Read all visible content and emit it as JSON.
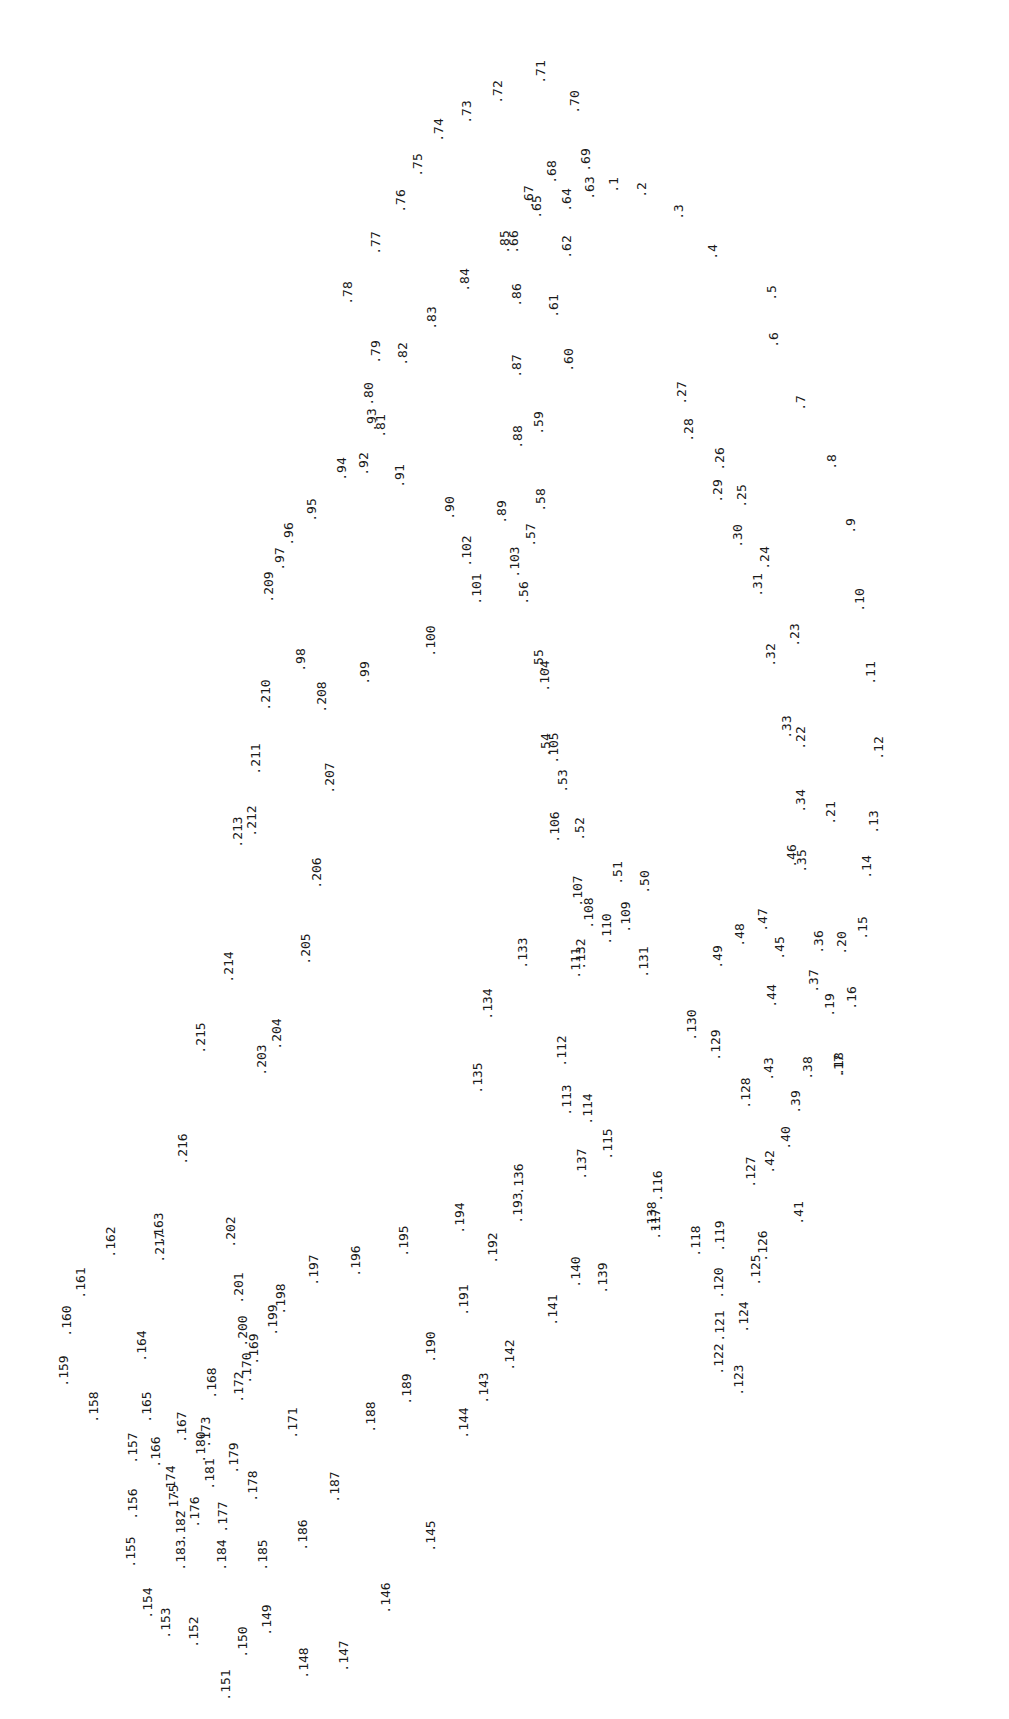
{
  "chart_data": {
    "type": "scatter",
    "title": "",
    "xlabel": "",
    "ylabel": "",
    "grid": false,
    "legend": null,
    "label_rotation_deg": -90,
    "note": "Dot-to-dot numbered point plot; each point is rendered as '.N' rotated 90° CCW. Coordinates are label-center pixel positions in the 1009x1719 image.",
    "points": [
      {
        "n": 1,
        "x": 613,
        "y": 185
      },
      {
        "n": 2,
        "x": 641,
        "y": 190
      },
      {
        "n": 3,
        "x": 678,
        "y": 212
      },
      {
        "n": 4,
        "x": 712,
        "y": 252
      },
      {
        "n": 5,
        "x": 771,
        "y": 293
      },
      {
        "n": 6,
        "x": 773,
        "y": 340
      },
      {
        "n": 7,
        "x": 800,
        "y": 403
      },
      {
        "n": 8,
        "x": 831,
        "y": 462
      },
      {
        "n": 9,
        "x": 850,
        "y": 526
      },
      {
        "n": 10,
        "x": 859,
        "y": 600
      },
      {
        "n": 11,
        "x": 870,
        "y": 673
      },
      {
        "n": 12,
        "x": 878,
        "y": 748
      },
      {
        "n": 13,
        "x": 873,
        "y": 822
      },
      {
        "n": 14,
        "x": 866,
        "y": 867
      },
      {
        "n": 15,
        "x": 862,
        "y": 928
      },
      {
        "n": 16,
        "x": 851,
        "y": 998
      },
      {
        "n": 17,
        "x": 838,
        "y": 1066
      },
      {
        "n": 18,
        "x": 838,
        "y": 1064
      },
      {
        "n": 19,
        "x": 829,
        "y": 1005
      },
      {
        "n": 20,
        "x": 841,
        "y": 943
      },
      {
        "n": 21,
        "x": 830,
        "y": 813
      },
      {
        "n": 22,
        "x": 800,
        "y": 738
      },
      {
        "n": 23,
        "x": 794,
        "y": 635
      },
      {
        "n": 24,
        "x": 764,
        "y": 558
      },
      {
        "n": 25,
        "x": 741,
        "y": 496
      },
      {
        "n": 26,
        "x": 719,
        "y": 459
      },
      {
        "n": 27,
        "x": 681,
        "y": 393
      },
      {
        "n": 28,
        "x": 688,
        "y": 430
      },
      {
        "n": 29,
        "x": 717,
        "y": 491
      },
      {
        "n": 30,
        "x": 737,
        "y": 536
      },
      {
        "n": 31,
        "x": 757,
        "y": 585
      },
      {
        "n": 32,
        "x": 770,
        "y": 655
      },
      {
        "n": 33,
        "x": 786,
        "y": 727
      },
      {
        "n": 34,
        "x": 800,
        "y": 801
      },
      {
        "n": 35,
        "x": 801,
        "y": 861
      },
      {
        "n": 36,
        "x": 818,
        "y": 942
      },
      {
        "n": 37,
        "x": 813,
        "y": 981
      },
      {
        "n": 38,
        "x": 807,
        "y": 1068
      },
      {
        "n": 39,
        "x": 795,
        "y": 1102
      },
      {
        "n": 40,
        "x": 785,
        "y": 1138
      },
      {
        "n": 41,
        "x": 798,
        "y": 1213
      },
      {
        "n": 42,
        "x": 769,
        "y": 1162
      },
      {
        "n": 43,
        "x": 768,
        "y": 1069
      },
      {
        "n": 44,
        "x": 771,
        "y": 996
      },
      {
        "n": 45,
        "x": 779,
        "y": 948
      },
      {
        "n": 46,
        "x": 791,
        "y": 856
      },
      {
        "n": 47,
        "x": 762,
        "y": 920
      },
      {
        "n": 48,
        "x": 739,
        "y": 935
      },
      {
        "n": 49,
        "x": 717,
        "y": 957
      },
      {
        "n": 50,
        "x": 644,
        "y": 882
      },
      {
        "n": 51,
        "x": 617,
        "y": 873
      },
      {
        "n": 52,
        "x": 579,
        "y": 829
      },
      {
        "n": 53,
        "x": 562,
        "y": 781
      },
      {
        "n": 54,
        "x": 545,
        "y": 745
      },
      {
        "n": 55,
        "x": 538,
        "y": 661
      },
      {
        "n": 56,
        "x": 523,
        "y": 593
      },
      {
        "n": 57,
        "x": 530,
        "y": 535
      },
      {
        "n": 58,
        "x": 540,
        "y": 500
      },
      {
        "n": 59,
        "x": 538,
        "y": 423
      },
      {
        "n": 60,
        "x": 568,
        "y": 360
      },
      {
        "n": 61,
        "x": 553,
        "y": 306
      },
      {
        "n": 62,
        "x": 566,
        "y": 247
      },
      {
        "n": 63,
        "x": 589,
        "y": 188
      },
      {
        "n": 64,
        "x": 566,
        "y": 200
      },
      {
        "n": 65,
        "x": 536,
        "y": 207
      },
      {
        "n": 66,
        "x": 513,
        "y": 242
      },
      {
        "n": 67,
        "x": 528,
        "y": 197
      },
      {
        "n": 68,
        "x": 551,
        "y": 172
      },
      {
        "n": 69,
        "x": 585,
        "y": 160
      },
      {
        "n": 70,
        "x": 574,
        "y": 102
      },
      {
        "n": 71,
        "x": 540,
        "y": 72
      },
      {
        "n": 72,
        "x": 497,
        "y": 92
      },
      {
        "n": 73,
        "x": 466,
        "y": 112
      },
      {
        "n": 74,
        "x": 438,
        "y": 130
      },
      {
        "n": 75,
        "x": 417,
        "y": 165
      },
      {
        "n": 76,
        "x": 400,
        "y": 201
      },
      {
        "n": 77,
        "x": 375,
        "y": 243
      },
      {
        "n": 78,
        "x": 347,
        "y": 293
      },
      {
        "n": 79,
        "x": 375,
        "y": 352
      },
      {
        "n": 80,
        "x": 368,
        "y": 394
      },
      {
        "n": 81,
        "x": 380,
        "y": 426
      },
      {
        "n": 82,
        "x": 402,
        "y": 354
      },
      {
        "n": 83,
        "x": 431,
        "y": 318
      },
      {
        "n": 84,
        "x": 464,
        "y": 280
      },
      {
        "n": 85,
        "x": 504,
        "y": 242
      },
      {
        "n": 86,
        "x": 516,
        "y": 295
      },
      {
        "n": 87,
        "x": 516,
        "y": 366
      },
      {
        "n": 88,
        "x": 517,
        "y": 437
      },
      {
        "n": 89,
        "x": 501,
        "y": 512
      },
      {
        "n": 90,
        "x": 449,
        "y": 508
      },
      {
        "n": 91,
        "x": 399,
        "y": 476
      },
      {
        "n": 92,
        "x": 363,
        "y": 464
      },
      {
        "n": 93,
        "x": 371,
        "y": 420
      },
      {
        "n": 94,
        "x": 341,
        "y": 469
      },
      {
        "n": 95,
        "x": 311,
        "y": 510
      },
      {
        "n": 96,
        "x": 288,
        "y": 534
      },
      {
        "n": 97,
        "x": 279,
        "y": 559
      },
      {
        "n": 98,
        "x": 300,
        "y": 660
      },
      {
        "n": 99,
        "x": 364,
        "y": 673
      },
      {
        "n": 100,
        "x": 430,
        "y": 641
      },
      {
        "n": 101,
        "x": 476,
        "y": 589
      },
      {
        "n": 102,
        "x": 466,
        "y": 551
      },
      {
        "n": 103,
        "x": 514,
        "y": 562
      },
      {
        "n": 104,
        "x": 544,
        "y": 676
      },
      {
        "n": 105,
        "x": 553,
        "y": 748
      },
      {
        "n": 106,
        "x": 554,
        "y": 827
      },
      {
        "n": 107,
        "x": 577,
        "y": 891
      },
      {
        "n": 108,
        "x": 588,
        "y": 913
      },
      {
        "n": 109,
        "x": 625,
        "y": 917
      },
      {
        "n": 110,
        "x": 606,
        "y": 929
      },
      {
        "n": 111,
        "x": 575,
        "y": 963
      },
      {
        "n": 112,
        "x": 561,
        "y": 1051
      },
      {
        "n": 113,
        "x": 566,
        "y": 1100
      },
      {
        "n": 114,
        "x": 587,
        "y": 1109
      },
      {
        "n": 115,
        "x": 607,
        "y": 1144
      },
      {
        "n": 116,
        "x": 657,
        "y": 1186
      },
      {
        "n": 117,
        "x": 655,
        "y": 1224
      },
      {
        "n": 118,
        "x": 695,
        "y": 1241
      },
      {
        "n": 119,
        "x": 719,
        "y": 1236
      },
      {
        "n": 120,
        "x": 718,
        "y": 1283
      },
      {
        "n": 121,
        "x": 719,
        "y": 1326
      },
      {
        "n": 122,
        "x": 718,
        "y": 1359
      },
      {
        "n": 123,
        "x": 738,
        "y": 1380
      },
      {
        "n": 124,
        "x": 743,
        "y": 1317
      },
      {
        "n": 125,
        "x": 755,
        "y": 1270
      },
      {
        "n": 126,
        "x": 762,
        "y": 1246
      },
      {
        "n": 127,
        "x": 750,
        "y": 1172
      },
      {
        "n": 128,
        "x": 745,
        "y": 1093
      },
      {
        "n": 129,
        "x": 715,
        "y": 1045
      },
      {
        "n": 130,
        "x": 691,
        "y": 1025
      },
      {
        "n": 131,
        "x": 643,
        "y": 962
      },
      {
        "n": 132,
        "x": 580,
        "y": 954
      },
      {
        "n": 133,
        "x": 522,
        "y": 953
      },
      {
        "n": 134,
        "x": 487,
        "y": 1004
      },
      {
        "n": 135,
        "x": 477,
        "y": 1078
      },
      {
        "n": 136,
        "x": 518,
        "y": 1179
      },
      {
        "n": 137,
        "x": 581,
        "y": 1164
      },
      {
        "n": 138,
        "x": 651,
        "y": 1217
      },
      {
        "n": 139,
        "x": 602,
        "y": 1278
      },
      {
        "n": 140,
        "x": 575,
        "y": 1272
      },
      {
        "n": 141,
        "x": 552,
        "y": 1310
      },
      {
        "n": 142,
        "x": 509,
        "y": 1355
      },
      {
        "n": 143,
        "x": 483,
        "y": 1388
      },
      {
        "n": 144,
        "x": 463,
        "y": 1423
      },
      {
        "n": 145,
        "x": 430,
        "y": 1536
      },
      {
        "n": 146,
        "x": 385,
        "y": 1598
      },
      {
        "n": 147,
        "x": 343,
        "y": 1656
      },
      {
        "n": 148,
        "x": 303,
        "y": 1663
      },
      {
        "n": 149,
        "x": 266,
        "y": 1620
      },
      {
        "n": 150,
        "x": 242,
        "y": 1642
      },
      {
        "n": 151,
        "x": 225,
        "y": 1685
      },
      {
        "n": 152,
        "x": 193,
        "y": 1632
      },
      {
        "n": 153,
        "x": 165,
        "y": 1623
      },
      {
        "n": 154,
        "x": 147,
        "y": 1603
      },
      {
        "n": 155,
        "x": 130,
        "y": 1552
      },
      {
        "n": 156,
        "x": 132,
        "y": 1504
      },
      {
        "n": 157,
        "x": 132,
        "y": 1448
      },
      {
        "n": 158,
        "x": 93,
        "y": 1407
      },
      {
        "n": 159,
        "x": 63,
        "y": 1371
      },
      {
        "n": 160,
        "x": 66,
        "y": 1321
      },
      {
        "n": 161,
        "x": 80,
        "y": 1283
      },
      {
        "n": 162,
        "x": 110,
        "y": 1242
      },
      {
        "n": 163,
        "x": 158,
        "y": 1228
      },
      {
        "n": 164,
        "x": 141,
        "y": 1346
      },
      {
        "n": 165,
        "x": 146,
        "y": 1407
      },
      {
        "n": 166,
        "x": 155,
        "y": 1452
      },
      {
        "n": 167,
        "x": 181,
        "y": 1427
      },
      {
        "n": 168,
        "x": 211,
        "y": 1383
      },
      {
        "n": 169,
        "x": 253,
        "y": 1349
      },
      {
        "n": 170,
        "x": 246,
        "y": 1368
      },
      {
        "n": 171,
        "x": 292,
        "y": 1423
      },
      {
        "n": 172,
        "x": 238,
        "y": 1387
      },
      {
        "n": 173,
        "x": 205,
        "y": 1432
      },
      {
        "n": 174,
        "x": 170,
        "y": 1481
      },
      {
        "n": 175,
        "x": 173,
        "y": 1500
      },
      {
        "n": 176,
        "x": 194,
        "y": 1512
      },
      {
        "n": 177,
        "x": 222,
        "y": 1517
      },
      {
        "n": 178,
        "x": 252,
        "y": 1486
      },
      {
        "n": 179,
        "x": 233,
        "y": 1458
      },
      {
        "n": 180,
        "x": 200,
        "y": 1447
      },
      {
        "n": 181,
        "x": 209,
        "y": 1474
      },
      {
        "n": 182,
        "x": 180,
        "y": 1526
      },
      {
        "n": 183,
        "x": 180,
        "y": 1555
      },
      {
        "n": 184,
        "x": 221,
        "y": 1555
      },
      {
        "n": 185,
        "x": 262,
        "y": 1555
      },
      {
        "n": 186,
        "x": 302,
        "y": 1535
      },
      {
        "n": 187,
        "x": 334,
        "y": 1487
      },
      {
        "n": 188,
        "x": 370,
        "y": 1417
      },
      {
        "n": 189,
        "x": 406,
        "y": 1389
      },
      {
        "n": 190,
        "x": 430,
        "y": 1347
      },
      {
        "n": 191,
        "x": 463,
        "y": 1300
      },
      {
        "n": 192,
        "x": 492,
        "y": 1248
      },
      {
        "n": 193,
        "x": 517,
        "y": 1208
      },
      {
        "n": 194,
        "x": 459,
        "y": 1218
      },
      {
        "n": 195,
        "x": 403,
        "y": 1241
      },
      {
        "n": 196,
        "x": 355,
        "y": 1261
      },
      {
        "n": 197,
        "x": 313,
        "y": 1270
      },
      {
        "n": 198,
        "x": 280,
        "y": 1299
      },
      {
        "n": 199,
        "x": 272,
        "y": 1320
      },
      {
        "n": 200,
        "x": 242,
        "y": 1331
      },
      {
        "n": 201,
        "x": 238,
        "y": 1288
      },
      {
        "n": 202,
        "x": 230,
        "y": 1232
      },
      {
        "n": 203,
        "x": 261,
        "y": 1060
      },
      {
        "n": 204,
        "x": 276,
        "y": 1034
      },
      {
        "n": 205,
        "x": 305,
        "y": 949
      },
      {
        "n": 206,
        "x": 316,
        "y": 873
      },
      {
        "n": 207,
        "x": 329,
        "y": 778
      },
      {
        "n": 208,
        "x": 321,
        "y": 697
      },
      {
        "n": 209,
        "x": 268,
        "y": 587
      },
      {
        "n": 210,
        "x": 265,
        "y": 695
      },
      {
        "n": 211,
        "x": 255,
        "y": 759
      },
      {
        "n": 212,
        "x": 251,
        "y": 821
      },
      {
        "n": 213,
        "x": 237,
        "y": 832
      },
      {
        "n": 214,
        "x": 228,
        "y": 967
      },
      {
        "n": 215,
        "x": 200,
        "y": 1038
      },
      {
        "n": 216,
        "x": 182,
        "y": 1149
      },
      {
        "n": 217,
        "x": 159,
        "y": 1247
      }
    ]
  }
}
